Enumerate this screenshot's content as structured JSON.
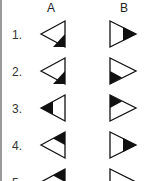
{
  "columns": [
    {
      "label": "A",
      "x": 47
    },
    {
      "label": "B",
      "x": 120
    }
  ],
  "rows": [
    {
      "label": "1.",
      "a": {
        "direction": "left",
        "shade": "bottom-right"
      },
      "b": {
        "direction": "right",
        "shade": "tip"
      }
    },
    {
      "label": "2.",
      "a": {
        "direction": "left",
        "shade": "bottom-right"
      },
      "b": {
        "direction": "right",
        "shade": "bottom-left"
      }
    },
    {
      "label": "3.",
      "a": {
        "direction": "left",
        "shade": "tip"
      },
      "b": {
        "direction": "right",
        "shade": "top-left"
      }
    },
    {
      "label": "4.",
      "a": {
        "direction": "left",
        "shade": "top-right"
      },
      "b": {
        "direction": "right",
        "shade": "tip"
      }
    },
    {
      "label": "5.",
      "a": {
        "direction": "left",
        "shade": "top-right"
      },
      "b": {
        "direction": "right",
        "shade": "none"
      }
    }
  ],
  "colors": {
    "stroke": "#111111",
    "fill": "#111111",
    "rule": "#9a9a9a"
  }
}
